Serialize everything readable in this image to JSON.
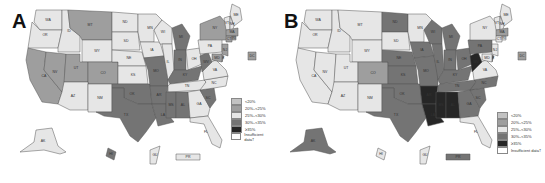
{
  "colors": {
    "lt20": "#c2c2c2",
    "20to25": "#9e9e9e",
    "25to30": "#e6e6e6",
    "30to35": "#747474",
    "ge35": "#262626",
    "insufficient": "#ffffff"
  },
  "panels": [
    {
      "label": "A",
      "legend": [
        {
          "key": "lt20",
          "label": "<20%"
        },
        {
          "key": "20to25",
          "label": "20%–<25%"
        },
        {
          "key": "25to30",
          "label": "25%–<30%"
        },
        {
          "key": "30to35",
          "label": "30%–<35%"
        },
        {
          "key": "ge35",
          "label": "≥35%"
        },
        {
          "key": "insufficient",
          "label": "Insufficient data†"
        }
      ]
    },
    {
      "label": "B",
      "legend": [
        {
          "key": "lt20",
          "label": "<20%"
        },
        {
          "key": "20to25",
          "label": "20%–<25%"
        },
        {
          "key": "25to30",
          "label": "25%–<30%"
        },
        {
          "key": "30to35",
          "label": "30%–<35%"
        },
        {
          "key": "ge35",
          "label": "≥35%"
        },
        {
          "key": "insufficient",
          "label": "Insufficient data†"
        }
      ]
    }
  ],
  "chart_data": [
    {
      "type": "heatmap",
      "title": "A",
      "categories": [
        "<20%",
        "20%–<25%",
        "25%–<30%",
        "30%–<35%",
        "≥35%",
        "Insufficient data†"
      ],
      "states": {
        "WA": "25to30",
        "OR": "25to30",
        "ID": "25to30",
        "MT": "20to25",
        "WY": "25to30",
        "CA": "20to25",
        "NV": "20to25",
        "UT": "20to25",
        "CO": "20to25",
        "AZ": "25to30",
        "NM": "25to30",
        "ND": "25to30",
        "SD": "25to30",
        "NE": "25to30",
        "KS": "25to30",
        "OK": "30to35",
        "TX": "30to35",
        "MN": "25to30",
        "IA": "25to30",
        "MO": "30to35",
        "AR": "30to35",
        "LA": "30to35",
        "WI": "25to30",
        "IL": "25to30",
        "MI": "30to35",
        "IN": "30to35",
        "OH": "25to30",
        "KY": "30to35",
        "TN": "25to30",
        "MS": "30to35",
        "AL": "30to35",
        "GA": "25to30",
        "FL": "25to30",
        "SC": "30to35",
        "NC": "25to30",
        "VA": "25to30",
        "WV": "30to35",
        "PA": "25to30",
        "NY": "20to25",
        "ME": "25to30",
        "VT": "25to30",
        "NH": "25to30",
        "MA": "20to25",
        "CT": "20to25",
        "RI": "20to25",
        "NJ": "20to25",
        "DE": "20to25",
        "MD": "20to25",
        "DC": "20to25",
        "AK": "25to30",
        "HI": "30to35",
        "GU": "25to30",
        "PR": "25to30"
      }
    },
    {
      "type": "heatmap",
      "title": "B",
      "categories": [
        "<20%",
        "20%–<25%",
        "25%–<30%",
        "30%–<35%",
        "≥35%",
        "Insufficient data†"
      ],
      "states": {
        "WA": "25to30",
        "OR": "25to30",
        "ID": "25to30",
        "MT": "25to30",
        "WY": "25to30",
        "CA": "25to30",
        "NV": "25to30",
        "UT": "25to30",
        "CO": "20to25",
        "AZ": "25to30",
        "NM": "25to30",
        "ND": "30to35",
        "SD": "25to30",
        "NE": "30to35",
        "KS": "30to35",
        "OK": "30to35",
        "TX": "30to35",
        "MN": "25to30",
        "IA": "30to35",
        "MO": "30to35",
        "AR": "ge35",
        "LA": "ge35",
        "WI": "30to35",
        "IL": "30to35",
        "MI": "30to35",
        "IN": "30to35",
        "OH": "30to35",
        "KY": "30to35",
        "TN": "30to35",
        "MS": "ge35",
        "AL": "ge35",
        "GA": "30to35",
        "FL": "25to30",
        "SC": "30to35",
        "NC": "30to35",
        "VA": "25to30",
        "WV": "ge35",
        "PA": "30to35",
        "NY": "25to30",
        "ME": "25to30",
        "VT": "25to30",
        "NH": "25to30",
        "MA": "20to25",
        "CT": "25to30",
        "RI": "25to30",
        "NJ": "25to30",
        "DE": "30to35",
        "MD": "25to30",
        "DC": "20to25",
        "AK": "30to35",
        "HI": "25to30",
        "GU": "25to30",
        "PR": "30to35"
      }
    }
  ]
}
